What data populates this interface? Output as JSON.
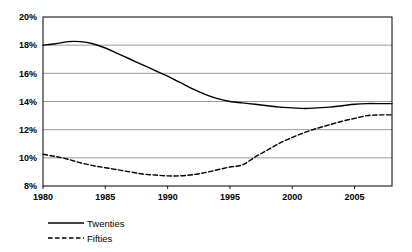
{
  "chart_data": {
    "type": "line",
    "title": "",
    "xlabel": "",
    "ylabel": "",
    "xlim": [
      1980,
      2008
    ],
    "ylim": [
      8,
      20
    ],
    "ytick_values": [
      8,
      10,
      12,
      14,
      16,
      18,
      20
    ],
    "ytick_labels": [
      "8%",
      "10%",
      "12%",
      "14%",
      "16%",
      "18%",
      "20%"
    ],
    "xtick_values": [
      1980,
      1985,
      1990,
      1995,
      2000,
      2005
    ],
    "xtick_labels": [
      "1980",
      "1985",
      "1990",
      "1995",
      "2000",
      "2005"
    ],
    "grid": true,
    "grid_axis": "y",
    "legend_position": "bottom-left",
    "x": [
      1980,
      1981,
      1982,
      1983,
      1984,
      1985,
      1986,
      1987,
      1988,
      1989,
      1990,
      1991,
      1992,
      1993,
      1994,
      1995,
      1996,
      1997,
      1998,
      1999,
      2000,
      2001,
      2002,
      2003,
      2004,
      2005,
      2006,
      2007,
      2008
    ],
    "series": [
      {
        "name": "Twenties",
        "style": "solid",
        "color": "#000000",
        "values": [
          18.0,
          18.1,
          18.25,
          18.25,
          18.1,
          17.8,
          17.4,
          17.0,
          16.6,
          16.2,
          15.8,
          15.35,
          14.9,
          14.5,
          14.2,
          14.0,
          13.9,
          13.8,
          13.7,
          13.6,
          13.55,
          13.5,
          13.55,
          13.6,
          13.7,
          13.8,
          13.85,
          13.85,
          13.85
        ]
      },
      {
        "name": "Fifties",
        "style": "dashed",
        "color": "#000000",
        "values": [
          10.25,
          10.1,
          9.9,
          9.65,
          9.45,
          9.3,
          9.15,
          9.0,
          8.85,
          8.78,
          8.72,
          8.72,
          8.8,
          8.95,
          9.15,
          9.35,
          9.5,
          10.05,
          10.55,
          11.05,
          11.45,
          11.8,
          12.1,
          12.35,
          12.6,
          12.8,
          13.0,
          13.05,
          13.05
        ]
      }
    ],
    "legend": [
      {
        "label": "Twenties",
        "style": "solid"
      },
      {
        "label": "Fifties",
        "style": "dashed"
      }
    ]
  },
  "layout": {
    "plot": {
      "left": 43,
      "top": 17,
      "right": 392,
      "bottom": 186
    }
  }
}
